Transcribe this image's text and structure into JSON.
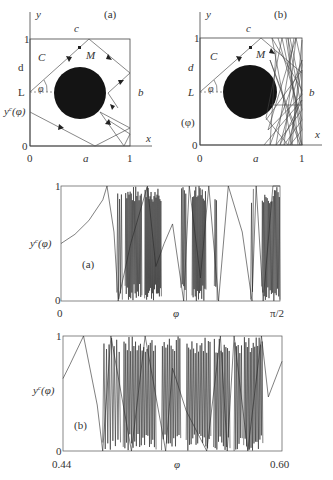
{
  "diagram_a": {
    "panel_label": "(a)",
    "axis_y": "y",
    "axis_x": "x",
    "top_edge": "c",
    "right_edge": "b",
    "bottom_edge": "a",
    "left_upper": "d",
    "corner_label": "C",
    "point_label": "M",
    "launch_label": "L",
    "angle_label": "φ",
    "exit_label": "y",
    "exit_sup": "c",
    "exit_arg": "(φ)",
    "tick_y_top": "1",
    "tick_y_bottom": "0",
    "tick_x_left": "0",
    "tick_x_right": "1"
  },
  "diagram_b": {
    "panel_label": "(b)",
    "axis_y": "y",
    "axis_x": "x",
    "top_edge": "c",
    "right_edge": "b",
    "bottom_edge": "a",
    "left_upper": "d",
    "corner_label": "C",
    "point_label": "M",
    "launch_label": "L",
    "angle_label": "φ",
    "exit_label": "(φ)",
    "tick_y_top": "1",
    "tick_y_bottom": "0",
    "tick_x_left": "0",
    "tick_x_right": "1"
  },
  "chart_data": [
    {
      "type": "line",
      "panel_label": "(a)",
      "title": "",
      "xlabel": "φ",
      "ylabel": "y^c(φ)",
      "x_ticks": [
        "0",
        "π/2"
      ],
      "y_ticks": [
        "0",
        "1"
      ],
      "xlim": [
        0,
        1.5708
      ],
      "ylim": [
        0,
        1
      ],
      "grid": false,
      "description": "Exit coordinate vs launch angle; smooth at small φ then chaotic bands",
      "x": [
        0.0,
        0.1,
        0.2,
        0.3,
        0.33,
        0.38,
        0.41,
        0.5,
        0.62,
        0.68,
        0.74,
        0.8,
        0.88,
        0.92,
        1.0,
        1.06,
        1.13,
        1.2,
        1.3,
        1.37,
        1.4,
        1.45,
        1.52,
        1.57
      ],
      "y": [
        0.5,
        0.58,
        0.7,
        0.88,
        1.0,
        0.6,
        0.0,
        0.5,
        1.0,
        0.3,
        0.5,
        0.67,
        0.0,
        1.0,
        0.2,
        1.0,
        0.0,
        1.0,
        0.6,
        0.0,
        1.0,
        0.0,
        1.0,
        1.0
      ]
    },
    {
      "type": "line",
      "panel_label": "(b)",
      "title": "",
      "xlabel": "φ",
      "ylabel": "y^c(φ)",
      "x_ticks": [
        "0.44",
        "0.60"
      ],
      "y_ticks": [
        "0",
        "1"
      ],
      "xlim": [
        0.44,
        0.6
      ],
      "ylim": [
        0,
        1
      ],
      "grid": false,
      "description": "Zoom of exit coordinate vs φ between 0.44 and 0.60 showing fractal chaotic bands",
      "x": [
        0.44,
        0.445,
        0.455,
        0.465,
        0.469,
        0.475,
        0.49,
        0.5,
        0.515,
        0.52,
        0.53,
        0.545,
        0.555,
        0.56,
        0.565,
        0.575,
        0.585,
        0.59,
        0.6
      ],
      "y": [
        0.63,
        0.75,
        1.0,
        0.4,
        0.0,
        1.0,
        0.0,
        1.0,
        0.0,
        0.72,
        0.35,
        0.0,
        1.0,
        0.0,
        1.0,
        0.0,
        1.0,
        0.47,
        0.78
      ]
    }
  ]
}
